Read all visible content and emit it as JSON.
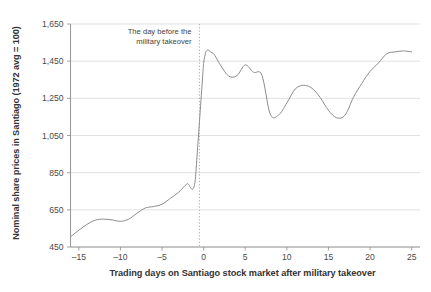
{
  "chart_data": {
    "type": "line",
    "title": "",
    "xlabel": "Trading days on Santiago stock market after military takeover",
    "ylabel": "Nominal share prices in Santiago (1972 avg = 100)",
    "xlim": [
      -16,
      26
    ],
    "ylim": [
      450,
      1650
    ],
    "xticks": [
      "–15",
      "–10",
      "–5",
      "0",
      "5",
      "10",
      "15",
      "20",
      "25"
    ],
    "xtick_values": [
      -15,
      -10,
      -5,
      0,
      5,
      10,
      15,
      20,
      25
    ],
    "yticks": [
      "450",
      "650",
      "850",
      "1,050",
      "1,250",
      "1,450",
      "1,650"
    ],
    "ytick_values": [
      450,
      650,
      850,
      1050,
      1250,
      1450,
      1650
    ],
    "grid": "horizontal",
    "legend": "none",
    "line_color": "#8c8c8c",
    "gridline_color": "#d9d9d9",
    "axis_color": "#9a9a9a",
    "series": [
      {
        "name": "Nominal share price index",
        "x": [
          -16,
          -15,
          -14,
          -13,
          -12,
          -11,
          -10,
          -9,
          -8,
          -7,
          -6,
          -5,
          -4,
          -3,
          -2,
          -1,
          0,
          1,
          2,
          3,
          4,
          5,
          6,
          7,
          8,
          9,
          10,
          11,
          12,
          13,
          14,
          15,
          16,
          17,
          18,
          19,
          20,
          21,
          22,
          23,
          24,
          25
        ],
        "y": [
          505,
          540,
          572,
          595,
          600,
          596,
          588,
          600,
          632,
          660,
          668,
          680,
          712,
          745,
          790,
          812,
          1440,
          1495,
          1430,
          1370,
          1372,
          1430,
          1390,
          1375,
          1165,
          1160,
          1225,
          1300,
          1320,
          1305,
          1255,
          1185,
          1145,
          1160,
          1255,
          1330,
          1395,
          1440,
          1490,
          1500,
          1505,
          1500
        ]
      }
    ],
    "annotations": [
      {
        "name": "takeover-annotation",
        "line1": "The day before the",
        "line2": "military takeover",
        "marker_x": -0.5,
        "marker_style": "dotted-vertical"
      }
    ]
  }
}
